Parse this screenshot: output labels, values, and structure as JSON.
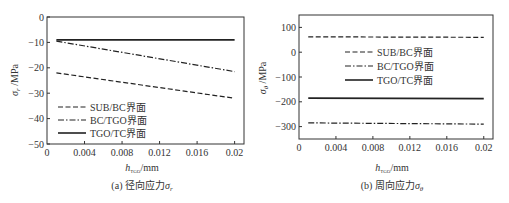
{
  "chart_data": [
    {
      "type": "line",
      "caption": "(a) 径向应力σr",
      "xlabel": "hTGO/mm",
      "ylabel": "σr /MPa",
      "xlim": [
        0,
        0.021
      ],
      "ylim": [
        -50,
        0
      ],
      "xticks": [
        "0",
        "0.004",
        "0.008",
        "0.012",
        "0.016",
        "0.02"
      ],
      "yticks": [
        "0",
        "-10",
        "-20",
        "-30",
        "-40",
        "-50"
      ],
      "grid": false,
      "legend_position": "lower-left",
      "x": [
        0.001,
        0.02
      ],
      "series": [
        {
          "name": "SUB/BC界面",
          "style": "dashed",
          "values": [
            -22,
            -32
          ]
        },
        {
          "name": "BC/TGO界面",
          "style": "dash-dot",
          "values": [
            -9.5,
            -21.5
          ]
        },
        {
          "name": "TGO/TC界面",
          "style": "solid",
          "values": [
            -9,
            -9
          ]
        }
      ]
    },
    {
      "type": "line",
      "caption": "(b) 周向应力σθ",
      "xlabel": "hTGO/mm",
      "ylabel": "σθ /MPa",
      "xlim": [
        0,
        0.021
      ],
      "ylim": [
        -350,
        150
      ],
      "xticks": [
        "0",
        "0.004",
        "0.008",
        "0.012",
        "0.016",
        "0.02"
      ],
      "yticks": [
        "100",
        "0",
        "-100",
        "-200",
        "-300"
      ],
      "grid": false,
      "legend_position": "upper-center",
      "x": [
        0.001,
        0.02
      ],
      "series": [
        {
          "name": "SUB/BC界面",
          "style": "dashed",
          "values": [
            62,
            60
          ]
        },
        {
          "name": "BC/TGO界面",
          "style": "dash-dot",
          "values": [
            -285,
            -290
          ]
        },
        {
          "name": "TGO/TC界面",
          "style": "solid",
          "values": [
            -185,
            -187
          ]
        }
      ]
    }
  ],
  "labels": {
    "a": {
      "ylabel_sym": "σ",
      "ylabel_sub": "r",
      "ylabel_unit": " /MPa",
      "xlabel_sym": "h",
      "xlabel_sub": "TGO",
      "xlabel_unit": "/mm",
      "caption_prefix": "(a)  径向应力",
      "caption_sym": "σ",
      "caption_sub": "r"
    },
    "b": {
      "ylabel_sym": "σ",
      "ylabel_sub": "θ",
      "ylabel_unit": " /MPa",
      "xlabel_sym": "h",
      "xlabel_sub": "TGO",
      "xlabel_unit": "/mm",
      "caption_prefix": "(b)  周向应力",
      "caption_sym": "σ",
      "caption_sub": "θ"
    }
  }
}
